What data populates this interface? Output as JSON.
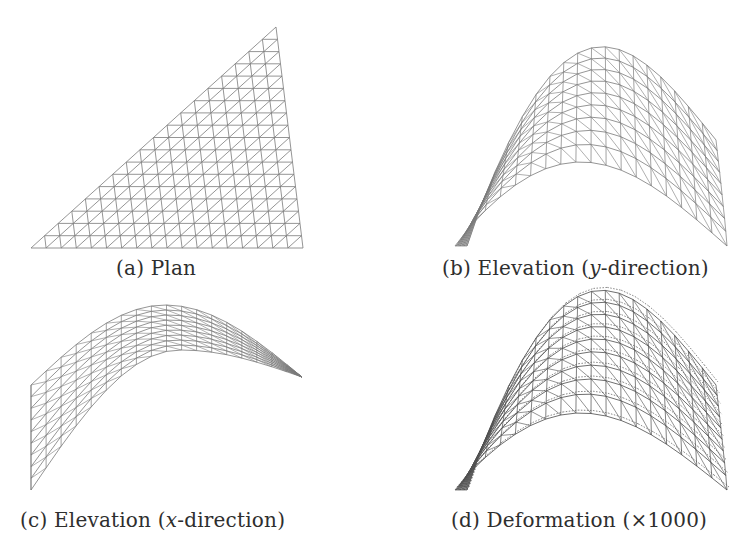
{
  "figure": {
    "panels": [
      {
        "id": "a",
        "label": "(a)",
        "title": "Plan",
        "view": "plan",
        "mesh": {
          "rows": 18,
          "apex": [
            276,
            27
          ],
          "bottom_left": [
            31,
            248
          ],
          "bottom_right": [
            303,
            248
          ]
        }
      },
      {
        "id": "b",
        "label": "(b)",
        "title_prefix": "Elevation (",
        "title_italic": "y",
        "title_suffix": "-direction)",
        "view": "elevation-y",
        "mesh": {
          "rows": 9,
          "cols": 18,
          "base_left": [
            455,
            246
          ],
          "base_right": [
            727,
            246
          ],
          "outer_peak_y": 100,
          "inner_peak_y": 162,
          "outer_right_top": [
            716,
            140
          ]
        }
      },
      {
        "id": "c",
        "label": "(c)",
        "title_prefix": "Elevation (",
        "title_italic": "x",
        "title_suffix": "-direction)",
        "view": "elevation-x",
        "mesh": {
          "rows": 9,
          "cols": 18,
          "left_x": 31,
          "left_bottom_y": 490,
          "left_top_y": 385,
          "peak": [
            170,
            305
          ],
          "inner_peak_y": 350,
          "right_tip": [
            302,
            377
          ]
        }
      },
      {
        "id": "d",
        "label": "(d)",
        "title_prefix": "Deformation (",
        "title_italic": "",
        "title_suffix": "×1000)",
        "view": "deformation",
        "mesh": {
          "rows": 9,
          "cols": 18,
          "base_left": [
            455,
            490
          ],
          "base_right": [
            727,
            490
          ],
          "outer_peak_y": 343,
          "inner_peak_y": 413,
          "outer_right_top": [
            716,
            385
          ]
        }
      }
    ],
    "line_color": "#7a7a7a",
    "dense_line_color": "#4a4a4a",
    "background": "#ffffff"
  }
}
